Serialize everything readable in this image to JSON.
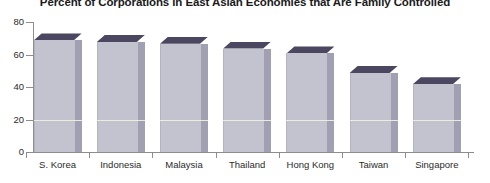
{
  "chart_data": {
    "type": "bar",
    "title": "Percent of Corporations in East Asian Economies that Are Family Controlled",
    "xlabel": "",
    "ylabel": "",
    "categories": [
      "S. Korea",
      "Indonesia",
      "Malaysia",
      "Thailand",
      "Hong Kong",
      "Taiwan",
      "Singapore"
    ],
    "values": [
      73,
      72,
      71,
      68,
      65,
      53,
      46
    ],
    "ylim": [
      0,
      80
    ],
    "yticks": [
      0,
      20,
      40,
      60,
      80
    ],
    "ytick_labels": [
      "0",
      "20",
      "40",
      "60",
      "80"
    ],
    "grid": false,
    "legend": null,
    "series": [
      {
        "name": "Percent family controlled",
        "values": [
          73,
          72,
          71,
          68,
          65,
          53,
          46
        ]
      }
    ],
    "style": {
      "bar_front_color": "#c3c3d0",
      "bar_side_color": "#a0a0b2",
      "bar_top_color": "#4c4760",
      "axis_color": "#8d8d8d",
      "text_color": "#2b2b2b",
      "background": "#ffffff",
      "gridline_color": "#eeeede"
    }
  }
}
